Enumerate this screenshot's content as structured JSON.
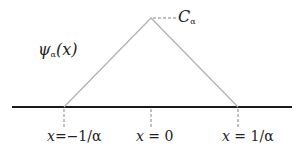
{
  "diagram": {
    "function_label": {
      "symbol": "ψ",
      "subscript": "α",
      "arg": "(x)"
    },
    "peak_label": {
      "symbol": "C",
      "subscript": "α"
    },
    "ticks": [
      {
        "var": "x",
        "eq": "=",
        "value": "−1/α"
      },
      {
        "var": "x",
        "eq": "=",
        "value": "0"
      },
      {
        "var": "x",
        "eq": "=",
        "value": "1/α"
      }
    ],
    "colors": {
      "triangle": "#b3b3b3",
      "axis": "#1a1a1a",
      "dash": "#777777",
      "text": "#222222"
    }
  }
}
